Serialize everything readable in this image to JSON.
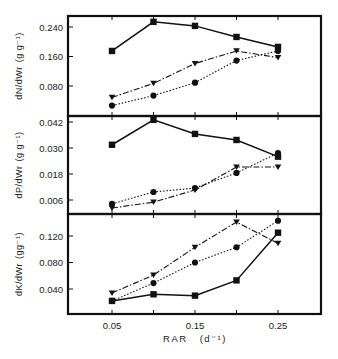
{
  "chart_data": [
    {
      "type": "line",
      "panel": "top",
      "ylabel": "dN/dWr (g g⁻¹)",
      "xlabel": "",
      "x": [
        0.05,
        0.1,
        0.15,
        0.2,
        0.25
      ],
      "yticks": [
        0.08,
        0.16,
        0.24
      ],
      "ytick_labels": [
        "0.080",
        "0.160",
        "0.240"
      ],
      "ylim": [
        0.0,
        0.272
      ],
      "series": [
        {
          "name": "squares (solid)",
          "marker": "square",
          "line": "solid",
          "values": [
            0.175,
            0.254,
            0.243,
            0.213,
            0.186
          ]
        },
        {
          "name": "triangles (dash-dot)",
          "marker": "triangle-down",
          "line": "dashdot",
          "values": [
            0.049,
            0.087,
            0.141,
            0.175,
            0.157
          ]
        },
        {
          "name": "circles (dotted)",
          "marker": "circle",
          "line": "dotted",
          "values": [
            0.027,
            0.054,
            0.089,
            0.149,
            0.175
          ]
        }
      ],
      "grid": false,
      "legend": "none"
    },
    {
      "type": "line",
      "panel": "middle",
      "ylabel": "dP/dWr (g g⁻¹)",
      "xlabel": "",
      "x": [
        0.05,
        0.1,
        0.15,
        0.2,
        0.25
      ],
      "yticks": [
        0.006,
        0.018,
        0.03,
        0.042
      ],
      "ytick_labels": [
        "0.006",
        "0.018",
        "0.030",
        "0.042"
      ],
      "ylim": [
        0.0,
        0.0438
      ],
      "series": [
        {
          "name": "squares (solid)",
          "marker": "square",
          "line": "solid",
          "values": [
            0.0315,
            0.043,
            0.0365,
            0.0337,
            0.026
          ]
        },
        {
          "name": "triangles (dash-dot)",
          "marker": "triangle-down",
          "line": "dashdot",
          "values": [
            0.0023,
            0.005,
            0.0106,
            0.0212,
            0.0212
          ]
        },
        {
          "name": "circles (dotted)",
          "marker": "circle",
          "line": "dotted",
          "values": [
            0.0042,
            0.0097,
            0.0115,
            0.0185,
            0.0277
          ]
        }
      ],
      "grid": false,
      "legend": "none"
    },
    {
      "type": "line",
      "panel": "bottom",
      "ylabel": "dK/dWr (gg⁻¹)",
      "xlabel": "RAR (d⁻¹)",
      "x": [
        0.05,
        0.1,
        0.15,
        0.2,
        0.25
      ],
      "xticks": [
        0.05,
        0.15,
        0.25
      ],
      "xtick_labels": [
        "0.05",
        "0.15",
        "0.25"
      ],
      "xlim": [
        0.0,
        0.3
      ],
      "yticks": [
        0.04,
        0.08,
        0.12
      ],
      "ytick_labels": [
        "0.040",
        "0.080",
        "0.120"
      ],
      "ylim": [
        0.0,
        0.153
      ],
      "series": [
        {
          "name": "squares (solid)",
          "marker": "square",
          "line": "solid",
          "values": [
            0.022,
            0.032,
            0.03,
            0.053,
            0.125
          ]
        },
        {
          "name": "triangles (dash-dot)",
          "marker": "triangle-down",
          "line": "dashdot",
          "values": [
            0.034,
            0.061,
            0.103,
            0.141,
            0.109
          ]
        },
        {
          "name": "circles (dotted)",
          "marker": "circle",
          "line": "dotted",
          "values": [
            0.022,
            0.049,
            0.08,
            0.103,
            0.143
          ]
        }
      ],
      "grid": false,
      "legend": "none"
    }
  ],
  "labels": {
    "panel_top_ylabel_main": "dN",
    "panel_top_ylabel_denom": "dWr",
    "panel_top_units": "(g g⁻¹)",
    "panel_mid_ylabel_main": "dP",
    "panel_mid_ylabel_denom": "dWr",
    "panel_mid_units": "(g g⁻¹)",
    "panel_bot_ylabel_main": "dK",
    "panel_bot_ylabel_denom": "dWr",
    "panel_bot_units": "(gg⁻¹)",
    "xlabel_main": "RAR",
    "xlabel_units": "(d⁻¹)"
  },
  "colors": {
    "ink": "#111111",
    "background": "#ffffff"
  }
}
